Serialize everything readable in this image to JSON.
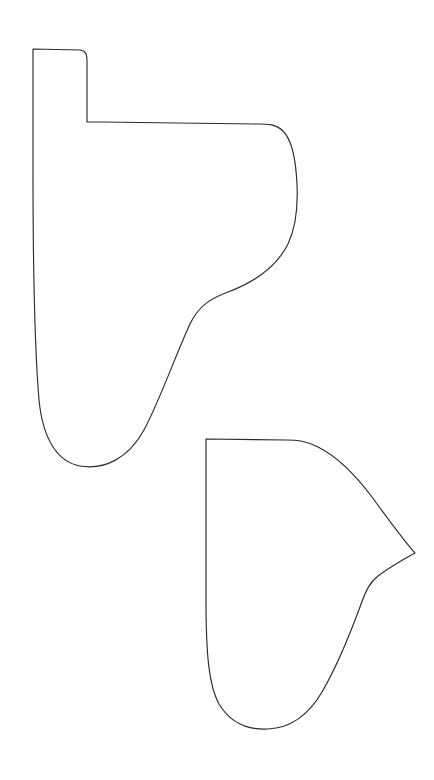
{
  "document": {
    "title": "Pattern Outline Sheet",
    "description": "Two closed freeform outline shapes drawn as thin black contour lines on a plain white sheet",
    "kind": "line-drawing",
    "background_color": "#ffffff",
    "stroke_color": "#2b2b2b",
    "stroke_width": 1.15,
    "canvas": {
      "width": 434,
      "height": 780,
      "units": "px"
    }
  },
  "shapes": [
    {
      "id": "shape-upper",
      "name": "upper-outline-shape",
      "label": "Upper pattern piece",
      "description": "Tall rounded form with a rectangular tab at the upper left, a long flat top edge, a bulging right lobe, an S-curve tapering inward, and a rounded U-shaped bottom",
      "closed": true,
      "fill": "none",
      "bbox": {
        "x": 31,
        "y": 48,
        "width": 267,
        "height": 421
      },
      "key_points": {
        "tab_top_left": [
          33,
          49
        ],
        "tab_top_right": [
          87,
          51
        ],
        "tab_inner_corner": [
          87,
          122
        ],
        "top_edge_right": [
          268,
          125
        ],
        "right_bulge_max": [
          298,
          222
        ],
        "s_curve_inflection": [
          228,
          292
        ],
        "waist_left": [
          189,
          320
        ],
        "bottom_low_point": [
          92,
          466
        ],
        "left_edge_top": [
          31,
          49
        ],
        "left_edge_bottom": [
          39,
          418
        ]
      },
      "path": "M 33 49 L 33 170 C 33 260 34 340 39 400 C 43 440 58 462 80 466 C 104 470 128 459 144 430 C 160 400 176 354 190 324 C 199 305 212 298 228 292 C 252 283 276 268 288 244 C 296 227 298 206 297 185 C 296 160 292 140 283 131 C 276 124 268 124 258 124 L 100 122 L 87 122 L 87 62 C 87 54 86 51 80 50 L 33 49 Z"
    },
    {
      "id": "shape-lower",
      "name": "lower-outline-shape",
      "label": "Lower pattern piece",
      "description": "Fan-like form with a flat top edge, a sweeping convex upper-right arc meeting a sharp outward vertex at the right, a concave S-curve descending to a rounded U-shaped bottom, and a near-vertical left edge",
      "closed": true,
      "fill": "none",
      "bbox": {
        "x": 204,
        "y": 438,
        "width": 212,
        "height": 292
      },
      "key_points": {
        "top_left_corner": [
          206,
          439
        ],
        "top_edge_right": [
          290,
          441
        ],
        "upper_arc_mid": [
          347,
          477
        ],
        "sharp_vertex": [
          415,
          553
        ],
        "concave_notch": [
          366,
          580
        ],
        "lower_s_mid": [
          325,
          640
        ],
        "bottom_low_point": [
          268,
          728
        ],
        "left_edge_bottom": [
          208,
          660
        ]
      },
      "path": "M 206 439 L 206 600 C 206 655 209 686 219 704 C 231 724 250 730 268 729 C 290 728 308 716 322 692 C 336 668 350 634 360 607 C 366 590 370 582 378 576 C 390 567 404 559 415 553 C 404 541 388 519 372 497 C 354 473 336 456 318 447 C 306 441 298 440 286 440 L 206 439 Z"
    }
  ]
}
